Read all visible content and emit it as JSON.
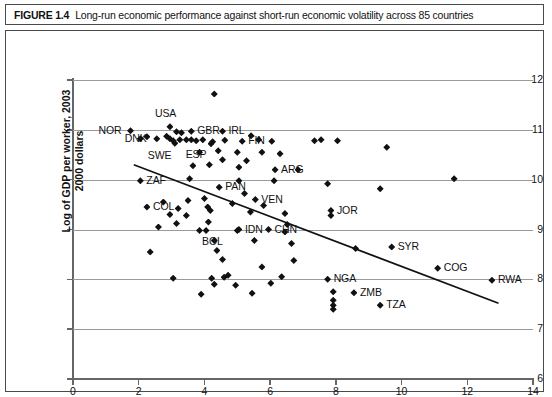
{
  "caption": {
    "label": "FIGURE 1.4",
    "text": "Long-run economic performance against short-run economic volatility across 85 countries"
  },
  "chart_data": {
    "type": "scatter",
    "title": "Long-run economic performance against short-run economic volatility across 85 countries",
    "xlabel": "Standard deviation of annual growth rate of GDP, 1961–2003",
    "ylabel": "Log of GDP per worker, 2003 2000 dollars",
    "ylabel_line1": "Log of GDP per worker, 2003",
    "ylabel_line2": "2000 dollars",
    "xlim": [
      0,
      14
    ],
    "ylim": [
      6,
      12
    ],
    "xticks": [
      0,
      2,
      4,
      6,
      8,
      10,
      12,
      14
    ],
    "yticks": [
      6,
      7,
      8,
      9,
      10,
      11,
      12
    ],
    "grid": "horizontal",
    "legend": "none",
    "marker": "diamond",
    "marker_color": "#111111",
    "trendline": {
      "present": true,
      "color": "#111111",
      "x_start": 1.85,
      "y_start": 10.3,
      "x_end": 12.95,
      "y_end": 7.52
    },
    "points": [
      {
        "x": 1.75,
        "y": 10.98,
        "label": "NOR",
        "label_side": "left"
      },
      {
        "x": 2.95,
        "y": 11.06,
        "label": "USA",
        "label_side": "top"
      },
      {
        "x": 3.6,
        "y": 10.97,
        "label": "GBR",
        "label_side": "right"
      },
      {
        "x": 2.55,
        "y": 10.82,
        "label": "DNK",
        "label_side": "left"
      },
      {
        "x": 3.1,
        "y": 10.73,
        "label": "SWE",
        "label_side": "below-left"
      },
      {
        "x": 4.55,
        "y": 10.97,
        "label": "IRL",
        "label_side": "right"
      },
      {
        "x": 4.25,
        "y": 10.76,
        "label": "ESP",
        "label_side": "below-left"
      },
      {
        "x": 5.15,
        "y": 10.77,
        "label": "FIN",
        "label_side": "right"
      },
      {
        "x": 6.15,
        "y": 10.2,
        "label": "ARG",
        "label_side": "right"
      },
      {
        "x": 2.05,
        "y": 9.98,
        "label": "ZAF",
        "label_side": "right"
      },
      {
        "x": 4.45,
        "y": 9.85,
        "label": "PAN",
        "label_side": "right"
      },
      {
        "x": 5.55,
        "y": 9.6,
        "label": "VEN",
        "label_side": "right"
      },
      {
        "x": 2.25,
        "y": 9.45,
        "label": "COL",
        "label_side": "right"
      },
      {
        "x": 7.85,
        "y": 9.38,
        "label": "JOR",
        "label_side": "right"
      },
      {
        "x": 4.05,
        "y": 8.98,
        "label": "BOL",
        "label_side": "below"
      },
      {
        "x": 5.05,
        "y": 9.0,
        "label": "IDN",
        "label_side": "right"
      },
      {
        "x": 5.95,
        "y": 9.0,
        "label": "CHN",
        "label_side": "right"
      },
      {
        "x": 9.7,
        "y": 8.65,
        "label": "SYR",
        "label_side": "right"
      },
      {
        "x": 11.1,
        "y": 8.22,
        "label": "COG",
        "label_side": "right"
      },
      {
        "x": 12.75,
        "y": 7.98,
        "label": "RWA",
        "label_side": "right"
      },
      {
        "x": 7.75,
        "y": 8.0,
        "label": "NGA",
        "label_side": "right"
      },
      {
        "x": 8.55,
        "y": 7.73,
        "label": "ZMB",
        "label_side": "right"
      },
      {
        "x": 9.35,
        "y": 7.48,
        "label": "TZA",
        "label_side": "right"
      },
      {
        "x": 4.3,
        "y": 11.72,
        "label": null
      },
      {
        "x": 3.15,
        "y": 10.96,
        "label": null
      },
      {
        "x": 3.3,
        "y": 10.94,
        "label": null
      },
      {
        "x": 2.85,
        "y": 10.87,
        "label": null
      },
      {
        "x": 2.95,
        "y": 10.82,
        "label": null
      },
      {
        "x": 3.05,
        "y": 10.78,
        "label": null
      },
      {
        "x": 3.25,
        "y": 10.8,
        "label": null
      },
      {
        "x": 3.45,
        "y": 10.8,
        "label": null
      },
      {
        "x": 3.6,
        "y": 10.8,
        "label": null
      },
      {
        "x": 3.75,
        "y": 10.78,
        "label": null
      },
      {
        "x": 3.95,
        "y": 10.8,
        "label": null
      },
      {
        "x": 4.2,
        "y": 10.72,
        "label": null
      },
      {
        "x": 4.62,
        "y": 10.79,
        "label": null
      },
      {
        "x": 5.65,
        "y": 10.8,
        "label": null
      },
      {
        "x": 5.42,
        "y": 10.88,
        "label": null
      },
      {
        "x": 6.05,
        "y": 10.77,
        "label": null
      },
      {
        "x": 7.35,
        "y": 10.78,
        "label": null
      },
      {
        "x": 7.55,
        "y": 10.8,
        "label": null
      },
      {
        "x": 8.05,
        "y": 10.78,
        "label": null
      },
      {
        "x": 9.55,
        "y": 10.65,
        "label": null
      },
      {
        "x": 5.0,
        "y": 10.55,
        "label": null
      },
      {
        "x": 5.75,
        "y": 10.55,
        "label": null
      },
      {
        "x": 6.3,
        "y": 10.52,
        "label": null
      },
      {
        "x": 5.28,
        "y": 10.38,
        "label": null
      },
      {
        "x": 4.55,
        "y": 10.4,
        "label": null
      },
      {
        "x": 5.05,
        "y": 10.25,
        "label": null
      },
      {
        "x": 4.15,
        "y": 10.3,
        "label": null
      },
      {
        "x": 3.65,
        "y": 10.28,
        "label": null
      },
      {
        "x": 7.75,
        "y": 9.92,
        "label": null
      },
      {
        "x": 11.6,
        "y": 10.02,
        "label": null
      },
      {
        "x": 3.55,
        "y": 10.02,
        "label": null
      },
      {
        "x": 5.05,
        "y": 9.98,
        "label": null
      },
      {
        "x": 6.12,
        "y": 9.98,
        "label": null
      },
      {
        "x": 5.22,
        "y": 9.72,
        "label": null
      },
      {
        "x": 4.0,
        "y": 9.62,
        "label": null
      },
      {
        "x": 3.5,
        "y": 9.58,
        "label": null
      },
      {
        "x": 2.75,
        "y": 9.55,
        "label": null
      },
      {
        "x": 4.1,
        "y": 9.45,
        "label": null
      },
      {
        "x": 4.18,
        "y": 9.38,
        "label": null
      },
      {
        "x": 3.2,
        "y": 9.42,
        "label": null
      },
      {
        "x": 2.95,
        "y": 9.3,
        "label": null
      },
      {
        "x": 3.45,
        "y": 9.28,
        "label": null
      },
      {
        "x": 5.4,
        "y": 9.35,
        "label": null
      },
      {
        "x": 6.45,
        "y": 9.32,
        "label": null
      },
      {
        "x": 7.85,
        "y": 9.28,
        "label": null
      },
      {
        "x": 6.52,
        "y": 9.1,
        "label": null
      },
      {
        "x": 3.15,
        "y": 9.12,
        "label": null
      },
      {
        "x": 4.12,
        "y": 9.15,
        "label": null
      },
      {
        "x": 2.6,
        "y": 9.05,
        "label": null
      },
      {
        "x": 3.85,
        "y": 8.98,
        "label": null
      },
      {
        "x": 6.45,
        "y": 8.95,
        "label": null
      },
      {
        "x": 5.52,
        "y": 8.78,
        "label": null
      },
      {
        "x": 4.3,
        "y": 8.78,
        "label": null
      },
      {
        "x": 6.65,
        "y": 8.72,
        "label": null
      },
      {
        "x": 4.38,
        "y": 8.58,
        "label": null
      },
      {
        "x": 2.35,
        "y": 8.55,
        "label": null
      },
      {
        "x": 4.55,
        "y": 8.4,
        "label": null
      },
      {
        "x": 6.72,
        "y": 8.38,
        "label": null
      },
      {
        "x": 5.75,
        "y": 8.25,
        "label": null
      },
      {
        "x": 3.05,
        "y": 8.02,
        "label": null
      },
      {
        "x": 4.22,
        "y": 8.02,
        "label": null
      },
      {
        "x": 4.6,
        "y": 8.04,
        "label": null
      },
      {
        "x": 4.72,
        "y": 8.08,
        "label": null
      },
      {
        "x": 6.35,
        "y": 8.05,
        "label": null
      },
      {
        "x": 4.95,
        "y": 7.88,
        "label": null
      },
      {
        "x": 4.3,
        "y": 7.9,
        "label": null
      },
      {
        "x": 6.02,
        "y": 7.92,
        "label": null
      },
      {
        "x": 3.9,
        "y": 7.7,
        "label": null
      },
      {
        "x": 5.45,
        "y": 7.72,
        "label": null
      },
      {
        "x": 7.92,
        "y": 7.75,
        "label": null
      },
      {
        "x": 7.92,
        "y": 7.58,
        "label": null
      },
      {
        "x": 7.92,
        "y": 7.48,
        "label": null
      },
      {
        "x": 7.92,
        "y": 7.4,
        "label": null
      },
      {
        "x": 9.35,
        "y": 9.82,
        "label": null
      },
      {
        "x": 4.85,
        "y": 9.52,
        "label": null
      },
      {
        "x": 5.8,
        "y": 9.48,
        "label": null
      },
      {
        "x": 3.85,
        "y": 10.55,
        "label": null
      },
      {
        "x": 4.42,
        "y": 10.58,
        "label": null
      },
      {
        "x": 2.05,
        "y": 10.82,
        "label": null
      },
      {
        "x": 2.25,
        "y": 10.86,
        "label": null
      },
      {
        "x": 6.85,
        "y": 10.2,
        "label": null
      },
      {
        "x": 8.6,
        "y": 8.62,
        "label": null
      },
      {
        "x": 5.0,
        "y": 8.98,
        "label": null
      }
    ]
  }
}
